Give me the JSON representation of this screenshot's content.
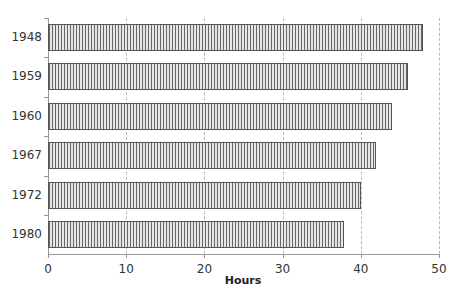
{
  "chart_data": {
    "type": "bar",
    "orientation": "horizontal",
    "title": "",
    "xlabel": "Hours",
    "ylabel": "",
    "categories": [
      "1948",
      "1959",
      "1960",
      "1967",
      "1972",
      "1980"
    ],
    "values": [
      48,
      46,
      44,
      42,
      40,
      37.8
    ],
    "xlim": [
      0,
      50
    ],
    "xticks": [
      0,
      10,
      20,
      30,
      40,
      50
    ],
    "grid": "vertical dashed",
    "legend": null
  },
  "labels": {
    "xlabel": "Hours",
    "xticks": [
      "0",
      "10",
      "20",
      "30",
      "40",
      "50"
    ],
    "categories": [
      "1948",
      "1959",
      "1960",
      "1967",
      "1972",
      "1980"
    ]
  }
}
